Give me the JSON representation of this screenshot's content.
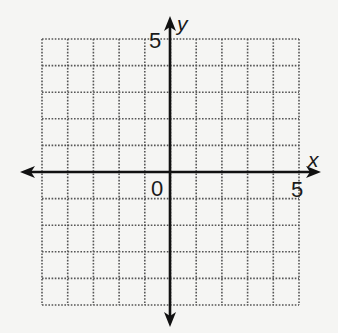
{
  "diagram": {
    "type": "coordinate-grid",
    "x_axis": {
      "label": "x",
      "tick_label": "5",
      "tick_value": 5
    },
    "y_axis": {
      "label": "y",
      "tick_label": "5",
      "tick_value": 5
    },
    "origin_label": "0",
    "grid": {
      "x_range": [
        -5,
        5
      ],
      "y_range": [
        -5,
        5
      ],
      "step": 1,
      "style": "dotted"
    },
    "colors": {
      "axis": "#111111",
      "grid": "#555555",
      "background": "#f5f5f3"
    }
  }
}
